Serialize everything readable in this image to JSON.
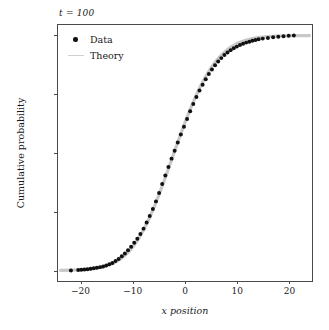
{
  "chart_data": {
    "type": "line",
    "title": "t = 100",
    "xlabel": "x position",
    "ylabel": "Cumulative probability",
    "xlim": [
      -24.5,
      24.5
    ],
    "ylim": [
      -0.045,
      1.045
    ],
    "xticks": [
      -20,
      -10,
      0,
      10,
      20
    ],
    "xticklabels": [
      "−20",
      "−10",
      "0",
      "10",
      "20"
    ],
    "yticks": [
      0.0,
      0.25,
      0.5,
      0.75,
      1.0
    ],
    "yticklabels": [
      "0.00",
      "0.25",
      "0.50",
      "0.75",
      "1.00"
    ],
    "grid": false,
    "legend_position": "upper left",
    "series": [
      {
        "name": "Data",
        "style": "markers",
        "color": "#111111",
        "x": [
          -22.0,
          -20.6,
          -20.0,
          -19.4,
          -18.8,
          -18.2,
          -17.6,
          -17.0,
          -16.4,
          -15.8,
          -15.2,
          -14.6,
          -14.0,
          -13.4,
          -12.8,
          -12.2,
          -11.6,
          -11.0,
          -10.4,
          -9.8,
          -9.2,
          -8.6,
          -8.0,
          -7.4,
          -6.8,
          -6.2,
          -5.6,
          -5.0,
          -4.4,
          -3.8,
          -3.2,
          -2.6,
          -2.0,
          -1.4,
          -0.8,
          -0.2,
          0.4,
          1.0,
          1.6,
          2.2,
          2.8,
          3.4,
          4.0,
          4.6,
          5.2,
          5.8,
          6.4,
          7.0,
          7.6,
          8.2,
          8.8,
          9.4,
          10.0,
          10.6,
          11.2,
          11.8,
          12.4,
          13.0,
          13.6,
          14.2,
          15.0,
          16.0,
          17.0,
          18.0,
          19.0,
          20.0,
          21.0
        ],
        "y": [
          0.0,
          0.002,
          0.003,
          0.004,
          0.005,
          0.007,
          0.009,
          0.011,
          0.014,
          0.017,
          0.021,
          0.026,
          0.032,
          0.04,
          0.049,
          0.06,
          0.072,
          0.086,
          0.101,
          0.118,
          0.135,
          0.155,
          0.178,
          0.204,
          0.232,
          0.262,
          0.294,
          0.33,
          0.368,
          0.404,
          0.44,
          0.476,
          0.51,
          0.545,
          0.579,
          0.612,
          0.645,
          0.678,
          0.709,
          0.738,
          0.766,
          0.791,
          0.814,
          0.836,
          0.856,
          0.874,
          0.89,
          0.904,
          0.917,
          0.928,
          0.938,
          0.946,
          0.953,
          0.96,
          0.965,
          0.97,
          0.974,
          0.978,
          0.981,
          0.984,
          0.987,
          0.99,
          0.993,
          0.995,
          0.997,
          0.999,
          1.0
        ]
      },
      {
        "name": "Theory",
        "style": "line",
        "color": "#c8c8c8",
        "x": [
          -24.0,
          -22.0,
          -20.0,
          -18.0,
          -16.0,
          -14.0,
          -12.0,
          -11.0,
          -10.0,
          -9.0,
          -8.0,
          -7.0,
          -6.0,
          -5.0,
          -4.0,
          -3.0,
          -2.0,
          -1.0,
          0.0,
          1.0,
          2.0,
          3.0,
          4.0,
          5.0,
          6.0,
          7.0,
          8.0,
          9.0,
          10.0,
          11.0,
          12.0,
          13.0,
          14.0,
          16.0,
          18.0,
          20.0,
          22.0,
          24.0
        ],
        "y": [
          0.0005,
          0.0012,
          0.0028,
          0.0063,
          0.0136,
          0.0283,
          0.0556,
          0.0758,
          0.1016,
          0.1335,
          0.1719,
          0.2166,
          0.2673,
          0.3231,
          0.3829,
          0.445,
          0.508,
          0.57,
          0.63,
          0.686,
          0.738,
          0.785,
          0.826,
          0.862,
          0.892,
          0.917,
          0.937,
          0.953,
          0.966,
          0.975,
          0.982,
          0.987,
          0.991,
          0.996,
          0.998,
          0.9993,
          0.9998,
          1.0
        ]
      }
    ]
  },
  "legend": {
    "items": [
      {
        "label": "Data",
        "marker": "filled-circle-marker",
        "color": "#111111"
      },
      {
        "label": "Theory",
        "marker": "line-swatch",
        "color": "#c8c8c8"
      }
    ]
  }
}
